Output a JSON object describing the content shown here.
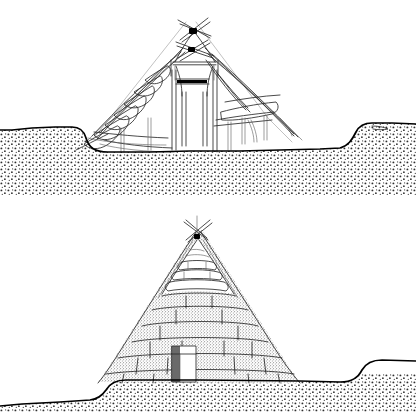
{
  "figure": {
    "style": "black-and-white pen-and-ink line drawing with stippled screen-tone",
    "panel_count": 2,
    "background_color": "#ffffff",
    "ink_color": "#2b2b2b",
    "ground_line_color": "#000000",
    "stipple_color": "#3a3a3a",
    "caption": ""
  },
  "panels": [
    {
      "id": "frame",
      "position": "top",
      "name": "timber-frame-stage",
      "description": "Cutaway section of the completed log and pole framework before earth covering",
      "elements": {
        "apex_label": "crossed finial poles",
        "apex_lashing_count": 2,
        "smoke_hole": "central square smoke hole frame",
        "center_posts": 4,
        "center_beam": "dark horizontal tie beam",
        "left_rafter_rungs": 9,
        "right_rafter_poles": 6,
        "excavated_pit": "sunken floor pit",
        "ground_surface": "original ground surface line"
      }
    },
    {
      "id": "covered",
      "position": "bottom",
      "name": "earth-covered-stage",
      "description": "The same lodge completed, mounded over with overlapping courses of sod and earth",
      "elements": {
        "apex_label": "crossed finial poles",
        "smoke_hole": "open smoke hole with exposed frame rungs at apex",
        "sod_courses": 6,
        "doorway": "entrance doorway at base of mound",
        "ground_surface": "original ground surface line",
        "covering": "stippled sod and earth blocks"
      }
    }
  ],
  "legend_keys": {
    "stipple_earth": "earth / subsoil",
    "stipple_sod": "sod and turf covering",
    "solid_black": "lashing joint",
    "open_line": "timber pole"
  },
  "icons": {
    "crossed-poles-icon": "X-shaped crossed finial poles",
    "doorway-icon": "rectangular entrance opening"
  }
}
